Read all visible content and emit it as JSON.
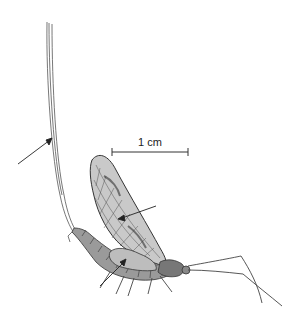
{
  "figure": {
    "scale_bar": {
      "label": "1 cm"
    },
    "arrows": [
      {
        "target": "cerci-tail-filaments"
      },
      {
        "target": "forewing"
      },
      {
        "target": "hindwing"
      }
    ],
    "colors": {
      "ink": "#333333",
      "wing_fill": "#c9c9c9",
      "background": "#ffffff"
    }
  }
}
